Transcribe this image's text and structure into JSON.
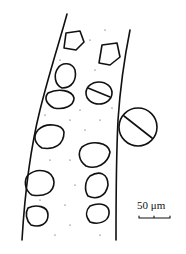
{
  "figure": {
    "type": "biological line drawing",
    "scale_bar": {
      "label": "50 μm"
    }
  },
  "colors": {
    "ink": "#111111",
    "background": "#ffffff"
  }
}
